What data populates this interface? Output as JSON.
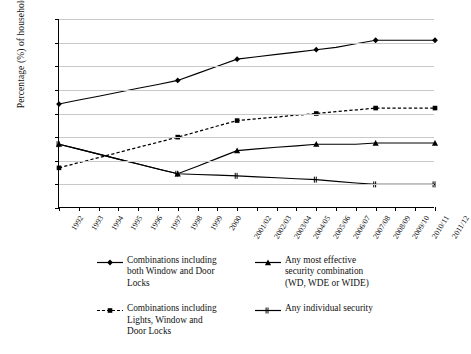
{
  "chart_data": {
    "type": "line",
    "title": "",
    "xlabel": "",
    "ylabel": "Percentage (%) of households",
    "ylim": [
      0,
      80
    ],
    "yticks": [
      0,
      10,
      20,
      30,
      40,
      50,
      60,
      70,
      80
    ],
    "grid": true,
    "legend_position": "bottom",
    "categories": [
      "1992",
      "1993",
      "1994",
      "1995",
      "1996",
      "1997",
      "1998",
      "1999",
      "2000",
      "2001/02",
      "2002/03",
      "2003/04",
      "2004/05",
      "2005/06",
      "2006/07",
      "2007/08",
      "2008/09",
      "2009/10",
      "2010/11",
      "2011/12"
    ],
    "series": [
      {
        "name": "Combinations including both Window and Door Locks",
        "marker": "diamond",
        "line": "solid",
        "color": "#000000",
        "values": [
          44,
          45.7,
          47.3,
          49,
          50.7,
          52.3,
          54,
          57,
          60,
          63,
          64,
          65,
          66,
          67,
          68,
          69.5,
          71,
          71,
          71,
          71
        ],
        "marker_at": [
          "1992",
          "1998",
          "2001/02",
          "2005/06",
          "2008/09",
          "2011/12"
        ]
      },
      {
        "name": "Any most effective security combination (WD, WDE or WIDE)",
        "marker": "triangle",
        "line": "solid",
        "color": "#000000",
        "values": [
          27,
          24.9,
          22.8,
          20.7,
          18.6,
          16.5,
          14.5,
          17.7,
          21,
          24.3,
          25,
          25.7,
          26.3,
          27,
          27,
          27,
          27.5,
          27.5,
          27.5,
          27.5
        ],
        "marker_at": [
          "1992",
          "1998",
          "2001/02",
          "2005/06",
          "2008/09",
          "2011/12"
        ]
      },
      {
        "name": "Combinations including Lights, Window and Door Locks",
        "marker": "square",
        "line": "dashed",
        "color": "#000000",
        "values": [
          17,
          19.2,
          21.3,
          23.5,
          25.7,
          27.8,
          30,
          32.3,
          34.7,
          37,
          37.8,
          38.5,
          39.3,
          40,
          40.8,
          41.5,
          42.3,
          42.3,
          42.3,
          42.3
        ],
        "marker_at": [
          "1992",
          "1998",
          "2001/02",
          "2005/06",
          "2008/09",
          "2011/12"
        ]
      },
      {
        "name": "Any individual security",
        "marker": "x-dash",
        "line": "solid",
        "color": "#000000",
        "values": [
          27,
          24.9,
          22.8,
          20.7,
          18.6,
          16.5,
          14.5,
          14.2,
          13.9,
          13.6,
          13.2,
          12.8,
          12.4,
          12,
          11.3,
          10.6,
          10,
          10,
          10,
          10
        ],
        "marker_at": [
          "1992",
          "1998",
          "2001/02",
          "2005/06",
          "2008/09",
          "2011/12"
        ]
      }
    ]
  },
  "legend": {
    "items": [
      {
        "label_lines": [
          "Combinations including",
          "both Window and Door",
          "Locks"
        ],
        "symbol": "diamond-solid-line"
      },
      {
        "label_lines": [
          "Any most effective",
          "security combination",
          "(WD, WDE or WIDE)"
        ],
        "symbol": "triangle-solid-line"
      },
      {
        "label_lines": [
          "Combinations including",
          "Lights, Window and",
          "Door Locks"
        ],
        "symbol": "square-dashed-line"
      },
      {
        "label_lines": [
          "Any individual security"
        ],
        "symbol": "x-solid-line"
      }
    ]
  },
  "axes": {
    "y_title": "Percentage (%) of households"
  }
}
